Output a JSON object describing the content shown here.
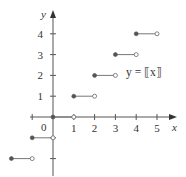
{
  "chart_data": {
    "type": "line",
    "title": "",
    "function_label": "y = ⟦x⟧",
    "xlabel": "x",
    "ylabel": "y",
    "xlim": [
      -2,
      5.8
    ],
    "ylim": [
      -2.8,
      5
    ],
    "origin_label": "0",
    "x_ticks": [
      -1,
      1,
      2,
      3,
      4,
      5
    ],
    "x_tick_labels": [
      "",
      "1",
      "2",
      "3",
      "4",
      "5"
    ],
    "y_ticks": [
      -2,
      -1,
      1,
      2,
      3,
      4
    ],
    "y_tick_labels": [
      "",
      "",
      "1",
      "2",
      "3",
      "4"
    ],
    "grid": false,
    "series": [
      {
        "name": "greatest integer function",
        "style": "step",
        "segments": [
          {
            "x_start": -2,
            "x_end": -1,
            "y": -2,
            "start": "closed",
            "end": "open"
          },
          {
            "x_start": -1,
            "x_end": 0,
            "y": -1,
            "start": "closed",
            "end": "open"
          },
          {
            "x_start": 0,
            "x_end": 1,
            "y": 0,
            "start": "closed",
            "end": "open"
          },
          {
            "x_start": 1,
            "x_end": 2,
            "y": 1,
            "start": "closed",
            "end": "open"
          },
          {
            "x_start": 2,
            "x_end": 3,
            "y": 2,
            "start": "closed",
            "end": "open"
          },
          {
            "x_start": 3,
            "x_end": 4,
            "y": 3,
            "start": "closed",
            "end": "open"
          },
          {
            "x_start": 4,
            "x_end": 5,
            "y": 4,
            "start": "closed",
            "end": "open"
          }
        ]
      }
    ],
    "colors": {
      "axis": "#555555",
      "line": "#777777",
      "text": "#333333"
    }
  }
}
